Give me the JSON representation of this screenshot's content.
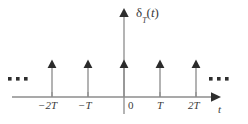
{
  "figure": {
    "kind": "impulse-train-plot",
    "title_label": "δ",
    "function_label": {
      "symbol": "δ",
      "subscript": "T",
      "argument_open": "(",
      "argument": "t",
      "argument_close": ")",
      "full": "δ_T(t)"
    },
    "axes": {
      "x_axis_label": "t",
      "y_axis_label": "δ_T(t)",
      "x_axis_color": "#8c8c8c",
      "y_axis_color": "#8c8c8c",
      "baseline_y_px": 97,
      "x_start_px": 12,
      "x_end_px": 220,
      "y_top_px": 10,
      "y_bottom_px": 114,
      "y_axis_x_px": 124
    },
    "ticks": [
      {
        "label": "−2T",
        "x_px": 52,
        "value": -2
      },
      {
        "label": "−T",
        "x_px": 88,
        "value": -1
      },
      {
        "label": "0",
        "x_px": 124,
        "value": 0
      },
      {
        "label": "T",
        "x_px": 160,
        "value": 1
      },
      {
        "label": "2T",
        "x_px": 196,
        "value": 2
      }
    ],
    "impulses": [
      {
        "x_px": 52,
        "value": -2,
        "height_px": 35,
        "color": "#6e6e6e"
      },
      {
        "x_px": 88,
        "value": -1,
        "height_px": 35,
        "color": "#6e6e6e"
      },
      {
        "x_px": 124,
        "value": 0,
        "height_px": 35,
        "color": "#4a4a4a"
      },
      {
        "x_px": 160,
        "value": 1,
        "height_px": 35,
        "color": "#6e6e6e"
      },
      {
        "x_px": 196,
        "value": 2,
        "height_px": 35,
        "color": "#6e6e6e"
      }
    ],
    "ellipsis_left": {
      "aria": "continues to negative infinity",
      "dots_x_px": [
        10,
        18,
        26
      ],
      "dots_y_px": 79
    },
    "ellipsis_right": {
      "aria": "continues to positive infinity",
      "dots_x_px": [
        211,
        219,
        227
      ],
      "dots_y_px": 79
    },
    "colors": {
      "ink": "#3b3b3b",
      "axis": "#8c8c8c",
      "impulse": "#6e6e6e",
      "dot": "#2e2e2e",
      "background": "#ffffff"
    }
  }
}
